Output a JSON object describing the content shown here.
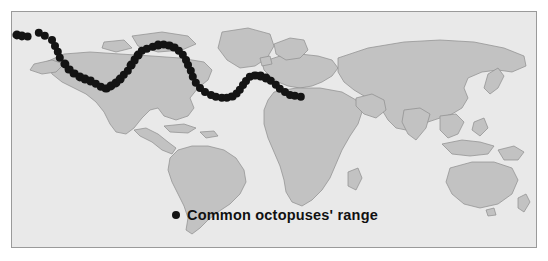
{
  "figure": {
    "type": "distribution-map",
    "frame": {
      "x": 11,
      "y": 11,
      "width": 526,
      "height": 237,
      "border_color": "#9a9a9a"
    },
    "page_background": "#ffffff"
  },
  "legend": {
    "marker_icon": "filled-circle-icon",
    "marker_color": "#141414",
    "label": "Common octopuses' range"
  },
  "chart_data": {
    "type": "scatter",
    "title": "Common octopuses' range",
    "subtitle": "",
    "xlabel": "",
    "ylabel": "",
    "projection": "equirectangular-world",
    "grid": false,
    "legend_position": "bottom-center",
    "xlim": [
      -180,
      180
    ],
    "ylim": [
      -90,
      90
    ],
    "colors": {
      "ocean": "#e9e9e9",
      "land": "#c2c2c2",
      "coastline": "#8d8d8d",
      "point": "#141414"
    },
    "series": [
      {
        "name": "Common octopuses' range",
        "marker": "circle",
        "color": "#141414",
        "points": [
          {
            "x": 4.5,
            "y": 22.5,
            "r": 4.6
          },
          {
            "x": 9.5,
            "y": 23.5,
            "r": 4.6
          },
          {
            "x": 15.5,
            "y": 24.5,
            "r": 4.4
          },
          {
            "x": 26.5,
            "y": 21.0,
            "r": 4.2
          },
          {
            "x": 33.0,
            "y": 23.5,
            "r": 4.2
          },
          {
            "x": 39.5,
            "y": 27.5,
            "r": 4.0
          },
          {
            "x": 42.5,
            "y": 33.5,
            "r": 4.0
          },
          {
            "x": 45.5,
            "y": 39.5,
            "r": 4.2
          },
          {
            "x": 47.5,
            "y": 46.0,
            "r": 4.2
          },
          {
            "x": 52.5,
            "y": 52.0,
            "r": 4.6
          },
          {
            "x": 57.0,
            "y": 57.5,
            "r": 4.4
          },
          {
            "x": 62.0,
            "y": 61.5,
            "r": 4.4
          },
          {
            "x": 67.5,
            "y": 64.5,
            "r": 4.6
          },
          {
            "x": 73.0,
            "y": 67.0,
            "r": 4.4
          },
          {
            "x": 78.5,
            "y": 69.0,
            "r": 4.4
          },
          {
            "x": 84.0,
            "y": 71.5,
            "r": 4.2
          },
          {
            "x": 89.0,
            "y": 74.5,
            "r": 4.2
          },
          {
            "x": 94.0,
            "y": 76.5,
            "r": 4.4
          },
          {
            "x": 99.0,
            "y": 74.0,
            "r": 4.6
          },
          {
            "x": 103.5,
            "y": 70.5,
            "r": 4.6
          },
          {
            "x": 108.0,
            "y": 67.0,
            "r": 4.4
          },
          {
            "x": 112.0,
            "y": 63.0,
            "r": 4.2
          },
          {
            "x": 115.5,
            "y": 58.5,
            "r": 4.2
          },
          {
            "x": 119.0,
            "y": 53.0,
            "r": 4.4
          },
          {
            "x": 122.5,
            "y": 48.0,
            "r": 4.4
          },
          {
            "x": 126.0,
            "y": 43.0,
            "r": 4.4
          },
          {
            "x": 130.0,
            "y": 39.0,
            "r": 4.2
          },
          {
            "x": 135.0,
            "y": 36.5,
            "r": 4.2
          },
          {
            "x": 140.5,
            "y": 34.5,
            "r": 4.2
          },
          {
            "x": 146.0,
            "y": 33.0,
            "r": 4.4
          },
          {
            "x": 151.5,
            "y": 32.5,
            "r": 4.4
          },
          {
            "x": 157.0,
            "y": 33.5,
            "r": 4.4
          },
          {
            "x": 162.0,
            "y": 35.5,
            "r": 4.4
          },
          {
            "x": 166.5,
            "y": 38.5,
            "r": 4.2
          },
          {
            "x": 170.5,
            "y": 42.5,
            "r": 4.2
          },
          {
            "x": 173.5,
            "y": 47.5,
            "r": 4.0
          },
          {
            "x": 176.0,
            "y": 53.0,
            "r": 4.0
          },
          {
            "x": 178.5,
            "y": 59.0,
            "r": 4.2
          },
          {
            "x": 181.0,
            "y": 65.0,
            "r": 4.2
          },
          {
            "x": 184.0,
            "y": 71.0,
            "r": 4.2
          },
          {
            "x": 188.0,
            "y": 76.0,
            "r": 4.0
          },
          {
            "x": 193.0,
            "y": 80.0,
            "r": 4.0
          },
          {
            "x": 198.5,
            "y": 83.0,
            "r": 4.0
          },
          {
            "x": 204.0,
            "y": 85.0,
            "r": 4.2
          },
          {
            "x": 209.5,
            "y": 86.0,
            "r": 4.2
          },
          {
            "x": 215.0,
            "y": 86.0,
            "r": 4.2
          },
          {
            "x": 220.0,
            "y": 84.5,
            "r": 4.4
          },
          {
            "x": 224.5,
            "y": 81.5,
            "r": 4.4
          },
          {
            "x": 228.0,
            "y": 77.5,
            "r": 4.2
          },
          {
            "x": 231.0,
            "y": 73.0,
            "r": 4.0
          },
          {
            "x": 234.0,
            "y": 68.5,
            "r": 4.0
          },
          {
            "x": 238.0,
            "y": 65.0,
            "r": 4.2
          },
          {
            "x": 243.0,
            "y": 63.5,
            "r": 4.4
          },
          {
            "x": 248.5,
            "y": 64.0,
            "r": 4.4
          },
          {
            "x": 254.0,
            "y": 66.0,
            "r": 4.4
          },
          {
            "x": 259.0,
            "y": 69.0,
            "r": 4.2
          },
          {
            "x": 263.5,
            "y": 72.5,
            "r": 4.2
          },
          {
            "x": 268.0,
            "y": 76.5,
            "r": 4.2
          },
          {
            "x": 272.5,
            "y": 80.0,
            "r": 4.0
          },
          {
            "x": 277.5,
            "y": 82.5,
            "r": 4.0
          },
          {
            "x": 283.0,
            "y": 84.0,
            "r": 4.2
          },
          {
            "x": 289.0,
            "y": 84.5,
            "r": 4.2
          }
        ]
      }
    ]
  },
  "regions": {
    "north_america_west": "Pacific coast of Alaska, British Columbia, California and Baja California",
    "north_america_east": "Atlantic coast from Nova Scotia to Florida",
    "caribbean": "Gulf of Mexico, Caribbean Sea and Greater Antilles",
    "south_america": "Atlantic coast of Brazil, Argentina and Pacific coast of Chile and Peru",
    "europe": "British Isles, North Sea, Iberian Peninsula and Mediterranean Sea",
    "africa": "West African coast, Gulf of Guinea, Cape region and East African coast",
    "asia": "Arabian Sea, Bay of Bengal, South China Sea, Japan and Korea",
    "oceania": "Indonesia, Philippines, New Guinea, Australia and New Zealand"
  }
}
